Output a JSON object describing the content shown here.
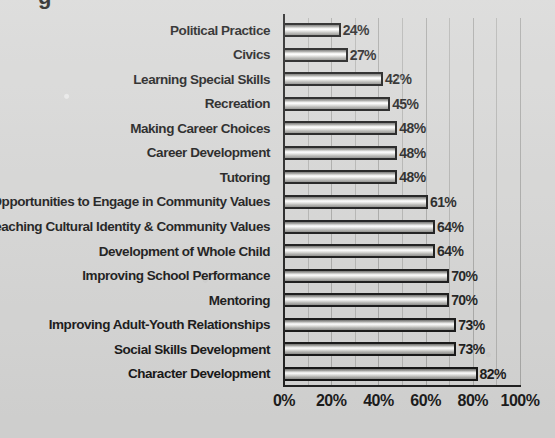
{
  "title_fragment": "g",
  "chart_data": {
    "type": "bar",
    "orientation": "horizontal",
    "title": "",
    "xlabel": "",
    "ylabel": "",
    "xlim": [
      0,
      100
    ],
    "xtick_labels": [
      "0%",
      "20%",
      "40%",
      "60%",
      "80%",
      "100%"
    ],
    "xtick_values": [
      0,
      20,
      40,
      60,
      80,
      100
    ],
    "grid": true,
    "grid_interval": 10,
    "legend": "none",
    "value_suffix": "%",
    "categories": [
      "Political Practice",
      "Civics",
      "Learning Special Skills",
      "Recreation",
      "Making Career Choices",
      "Career Development",
      "Tutoring",
      "Opportunities to Engage in Community Values",
      "Teaching Cultural Identity & Community Values",
      "Development of Whole Child",
      "Improving School Performance",
      "Mentoring",
      "Improving Adult-Youth Relationships",
      "Social Skills Development",
      "Character Development"
    ],
    "values": [
      24,
      27,
      42,
      45,
      48,
      48,
      48,
      61,
      64,
      64,
      70,
      70,
      73,
      73,
      82
    ],
    "value_labels": [
      "24%",
      "27%",
      "42%",
      "45%",
      "48%",
      "48%",
      "48%",
      "61%",
      "64%",
      "64%",
      "70%",
      "70%",
      "73%",
      "73%",
      "82%"
    ],
    "colors": {
      "bar_fill_light": "#ffffff",
      "bar_fill_dark": "#8d8d8a",
      "bar_border": "#121212",
      "background": "#d7d7d6",
      "gridline": "#b4b4b2",
      "axis": "#1d1d1d",
      "text": "#141414"
    }
  }
}
